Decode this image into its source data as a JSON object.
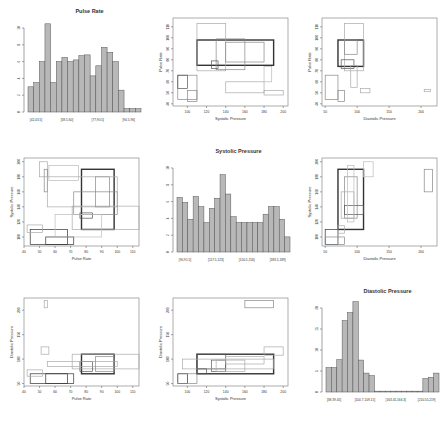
{
  "chart_data": [
    {
      "type": "bar",
      "cell": [
        0,
        0
      ],
      "title": "Pulse Rate",
      "xlabel": "",
      "ylabel": "",
      "ylim": [
        0,
        10
      ],
      "yticks": [
        0,
        2,
        4,
        6,
        8,
        10
      ],
      "categories": [
        "[42,43.5]",
        "",
        "",
        "",
        "",
        "[58.5,60]",
        "",
        "",
        "",
        "",
        "",
        "",
        "[77,90.5]",
        "",
        "",
        "",
        "",
        "[94.5,96]",
        "",
        "",
        ""
      ],
      "tick_labels": [
        "[42,43.5]",
        "[58.5,60]",
        "[77,90.5]",
        "[94.5,96]"
      ],
      "values": [
        3.0,
        3.5,
        6.0,
        10.5,
        3.5,
        6.0,
        6.5,
        6.0,
        6.2,
        6.7,
        6.8,
        4.3,
        5.5,
        7.7,
        7.1,
        6.0,
        2.6,
        0.4,
        0.4,
        0.4
      ]
    },
    {
      "type": "scatter",
      "cell": [
        0,
        1
      ],
      "title": "",
      "xlabel": "Systolic Pressure",
      "ylabel": "Pulse Rate",
      "xlim": [
        85,
        205
      ],
      "ylim": [
        38,
        118
      ],
      "xticks": [
        100,
        120,
        140,
        160,
        180,
        200
      ],
      "yticks": [
        40,
        50,
        60,
        70,
        80,
        90,
        100,
        110
      ],
      "rects": [
        {
          "x0": 110,
          "x1": 190,
          "y0": 75,
          "y1": 98,
          "w": 2,
          "c": "#333"
        },
        {
          "x0": 110,
          "x1": 140,
          "y0": 70,
          "y1": 113,
          "w": 1,
          "c": "#aaa"
        },
        {
          "x0": 130,
          "x1": 160,
          "y0": 71,
          "y1": 99,
          "w": 1,
          "c": "#888"
        },
        {
          "x0": 140,
          "x1": 180,
          "y0": 78,
          "y1": 96,
          "w": 1,
          "c": "#888"
        },
        {
          "x0": 125,
          "x1": 132,
          "y0": 72,
          "y1": 79,
          "w": 1,
          "c": "#555"
        },
        {
          "x0": 90,
          "x1": 110,
          "y0": 44,
          "y1": 66,
          "w": 1,
          "c": "#888"
        },
        {
          "x0": 90,
          "x1": 100,
          "y0": 54,
          "y1": 66,
          "w": 1,
          "c": "#555"
        },
        {
          "x0": 100,
          "x1": 110,
          "y0": 42,
          "y1": 52,
          "w": 1,
          "c": "#888"
        },
        {
          "x0": 140,
          "x1": 180,
          "y0": 50,
          "y1": 60,
          "w": 1,
          "c": "#aaa"
        },
        {
          "x0": 180,
          "x1": 200,
          "y0": 48,
          "y1": 52,
          "w": 1,
          "c": "#aaa"
        },
        {
          "x0": 180,
          "x1": 188,
          "y0": 60,
          "y1": 74,
          "w": 1,
          "c": "#bbb"
        }
      ]
    },
    {
      "type": "scatter",
      "cell": [
        0,
        2
      ],
      "title": "",
      "xlabel": "Diastolic Pressure",
      "ylabel": "Pulse Rate",
      "xlim": [
        45,
        225
      ],
      "ylim": [
        38,
        118
      ],
      "xticks": [
        50,
        100,
        150,
        200
      ],
      "yticks": [
        40,
        50,
        60,
        70,
        80,
        90,
        100,
        110
      ],
      "rects": [
        {
          "x0": 70,
          "x1": 110,
          "y0": 74,
          "y1": 98,
          "w": 2,
          "c": "#333"
        },
        {
          "x0": 80,
          "x1": 110,
          "y0": 70,
          "y1": 113,
          "w": 1,
          "c": "#aaa"
        },
        {
          "x0": 75,
          "x1": 95,
          "y0": 72,
          "y1": 80,
          "w": 1,
          "c": "#555"
        },
        {
          "x0": 80,
          "x1": 100,
          "y0": 85,
          "y1": 98,
          "w": 1,
          "c": "#888"
        },
        {
          "x0": 50,
          "x1": 70,
          "y0": 44,
          "y1": 66,
          "w": 1,
          "c": "#888"
        },
        {
          "x0": 70,
          "x1": 80,
          "y0": 42,
          "y1": 52,
          "w": 1,
          "c": "#888"
        },
        {
          "x0": 90,
          "x1": 100,
          "y0": 55,
          "y1": 75,
          "w": 1,
          "c": "#aaa"
        },
        {
          "x0": 105,
          "x1": 120,
          "y0": 50,
          "y1": 54,
          "w": 1,
          "c": "#aaa"
        },
        {
          "x0": 205,
          "x1": 215,
          "y0": 51,
          "y1": 53,
          "w": 1,
          "c": "#aaa"
        }
      ]
    },
    {
      "type": "scatter",
      "cell": [
        1,
        0
      ],
      "title": "",
      "xlabel": "Pulse Rate",
      "ylabel": "Systolic Pressure",
      "xlim": [
        40,
        114
      ],
      "ylim": [
        88,
        205
      ],
      "xticks": [
        40,
        50,
        60,
        70,
        80,
        90,
        100,
        110
      ],
      "yticks": [
        100,
        120,
        140,
        160,
        180,
        200
      ],
      "rects": [
        {
          "x0": 77,
          "x1": 98,
          "y0": 110,
          "y1": 190,
          "w": 2,
          "c": "#333"
        },
        {
          "x0": 71,
          "x1": 114,
          "y0": 110,
          "y1": 141,
          "w": 1,
          "c": "#aaa"
        },
        {
          "x0": 72,
          "x1": 100,
          "y0": 130,
          "y1": 160,
          "w": 1,
          "c": "#888"
        },
        {
          "x0": 86,
          "x1": 95,
          "y0": 140,
          "y1": 180,
          "w": 1,
          "c": "#888"
        },
        {
          "x0": 76,
          "x1": 84,
          "y0": 125,
          "y1": 132,
          "w": 1,
          "c": "#555"
        },
        {
          "x0": 44,
          "x1": 68,
          "y0": 90,
          "y1": 110,
          "w": 1,
          "c": "#333"
        },
        {
          "x0": 54,
          "x1": 72,
          "y0": 90,
          "y1": 100,
          "w": 1,
          "c": "#333"
        },
        {
          "x0": 42,
          "x1": 52,
          "y0": 106,
          "y1": 116,
          "w": 1,
          "c": "#aaa"
        },
        {
          "x0": 50,
          "x1": 55,
          "y0": 180,
          "y1": 200,
          "w": 1,
          "c": "#aaa"
        },
        {
          "x0": 53,
          "x1": 55,
          "y0": 160,
          "y1": 190,
          "w": 1,
          "c": "#888"
        },
        {
          "x0": 56,
          "x1": 75,
          "y0": 175,
          "y1": 195,
          "w": 1,
          "c": "#bbb"
        },
        {
          "x0": 55,
          "x1": 100,
          "y0": 140,
          "y1": 180,
          "w": 1,
          "c": "#aaa"
        },
        {
          "x0": 60,
          "x1": 90,
          "y0": 100,
          "y1": 130,
          "w": 1,
          "c": "#bbb"
        }
      ]
    },
    {
      "type": "bar",
      "cell": [
        1,
        1
      ],
      "title": "Systolic Pressure",
      "xlabel": "",
      "ylabel": "",
      "ylim": [
        0,
        10
      ],
      "yticks": [
        0,
        2,
        4,
        6,
        8,
        10
      ],
      "tick_labels": [
        "[90,91.5]",
        "[117.5,123]",
        "[150.5,156]",
        "[183.5,189]"
      ],
      "values": [
        6.5,
        5.9,
        3.9,
        6.6,
        5.4,
        3.5,
        5.2,
        6.4,
        9.2,
        6.9,
        4.2,
        3.5,
        3.5,
        3.5,
        3.5,
        3.5,
        4.5,
        5.4,
        5.4,
        3.9,
        1.8
      ]
    },
    {
      "type": "scatter",
      "cell": [
        1,
        2
      ],
      "title": "",
      "xlabel": "Diastolic Pressure",
      "ylabel": "Systolic Pressure",
      "xlim": [
        45,
        225
      ],
      "ylim": [
        88,
        205
      ],
      "xticks": [
        50,
        100,
        150,
        200
      ],
      "yticks": [
        100,
        120,
        140,
        160,
        180,
        200
      ],
      "rects": [
        {
          "x0": 70,
          "x1": 110,
          "y0": 110,
          "y1": 190,
          "w": 2,
          "c": "#333"
        },
        {
          "x0": 80,
          "x1": 100,
          "y0": 125,
          "y1": 180,
          "w": 1,
          "c": "#888"
        },
        {
          "x0": 75,
          "x1": 95,
          "y0": 125,
          "y1": 160,
          "w": 1,
          "c": "#aaa"
        },
        {
          "x0": 80,
          "x1": 110,
          "y0": 130,
          "y1": 142,
          "w": 1,
          "c": "#555"
        },
        {
          "x0": 85,
          "x1": 95,
          "y0": 120,
          "y1": 195,
          "w": 1,
          "c": "#bbb"
        },
        {
          "x0": 50,
          "x1": 70,
          "y0": 90,
          "y1": 110,
          "w": 1,
          "c": "#333"
        },
        {
          "x0": 50,
          "x1": 80,
          "y0": 90,
          "y1": 100,
          "w": 1,
          "c": "#888"
        },
        {
          "x0": 70,
          "x1": 80,
          "y0": 105,
          "y1": 115,
          "w": 1,
          "c": "#aaa"
        },
        {
          "x0": 110,
          "x1": 125,
          "y0": 180,
          "y1": 200,
          "w": 1,
          "c": "#bbb"
        },
        {
          "x0": 205,
          "x1": 218,
          "y0": 160,
          "y1": 190,
          "w": 1,
          "c": "#888"
        }
      ]
    },
    {
      "type": "scatter",
      "cell": [
        2,
        0
      ],
      "title": "",
      "xlabel": "Pulse Rate",
      "ylabel": "Diastolic Pressure",
      "xlim": [
        40,
        114
      ],
      "ylim": [
        45,
        225
      ],
      "xticks": [
        40,
        50,
        60,
        70,
        80,
        90,
        100,
        110
      ],
      "yticks": [
        50,
        100,
        150,
        200
      ],
      "rects": [
        {
          "x0": 77,
          "x1": 98,
          "y0": 70,
          "y1": 110,
          "w": 2,
          "c": "#333"
        },
        {
          "x0": 71,
          "x1": 114,
          "y0": 80,
          "y1": 110,
          "w": 1,
          "c": "#aaa"
        },
        {
          "x0": 76,
          "x1": 84,
          "y0": 75,
          "y1": 95,
          "w": 1,
          "c": "#555"
        },
        {
          "x0": 55,
          "x1": 100,
          "y0": 85,
          "y1": 95,
          "w": 1,
          "c": "#aaa"
        },
        {
          "x0": 86,
          "x1": 98,
          "y0": 75,
          "y1": 105,
          "w": 1,
          "c": "#888"
        },
        {
          "x0": 44,
          "x1": 68,
          "y0": 50,
          "y1": 70,
          "w": 1,
          "c": "#333"
        },
        {
          "x0": 54,
          "x1": 72,
          "y0": 50,
          "y1": 70,
          "w": 1,
          "c": "#333"
        },
        {
          "x0": 42,
          "x1": 52,
          "y0": 65,
          "y1": 78,
          "w": 1,
          "c": "#aaa"
        },
        {
          "x0": 51,
          "x1": 56,
          "y0": 110,
          "y1": 125,
          "w": 1,
          "c": "#aaa"
        },
        {
          "x0": 53,
          "x1": 55,
          "y0": 205,
          "y1": 220,
          "w": 1,
          "c": "#aaa"
        }
      ]
    },
    {
      "type": "scatter",
      "cell": [
        2,
        1
      ],
      "title": "",
      "xlabel": "Systolic Pressure",
      "ylabel": "Diastolic Pressure",
      "xlim": [
        85,
        205
      ],
      "ylim": [
        45,
        225
      ],
      "xticks": [
        100,
        120,
        140,
        160,
        180,
        200
      ],
      "yticks": [
        50,
        100,
        150,
        200
      ],
      "rects": [
        {
          "x0": 110,
          "x1": 190,
          "y0": 70,
          "y1": 110,
          "w": 2,
          "c": "#333"
        },
        {
          "x0": 110,
          "x1": 140,
          "y0": 80,
          "y1": 110,
          "w": 1,
          "c": "#555"
        },
        {
          "x0": 125,
          "x1": 140,
          "y0": 75,
          "y1": 98,
          "w": 1,
          "c": "#555"
        },
        {
          "x0": 130,
          "x1": 160,
          "y0": 75,
          "y1": 98,
          "w": 1,
          "c": "#aaa"
        },
        {
          "x0": 95,
          "x1": 190,
          "y0": 80,
          "y1": 100,
          "w": 1,
          "c": "#aaa"
        },
        {
          "x0": 140,
          "x1": 180,
          "y0": 90,
          "y1": 105,
          "w": 1,
          "c": "#aaa"
        },
        {
          "x0": 180,
          "x1": 200,
          "y0": 108,
          "y1": 125,
          "w": 1,
          "c": "#aaa"
        },
        {
          "x0": 90,
          "x1": 100,
          "y0": 50,
          "y1": 70,
          "w": 1,
          "c": "#333"
        },
        {
          "x0": 90,
          "x1": 110,
          "y0": 50,
          "y1": 70,
          "w": 1,
          "c": "#888"
        },
        {
          "x0": 110,
          "x1": 120,
          "y0": 70,
          "y1": 80,
          "w": 1,
          "c": "#555"
        },
        {
          "x0": 160,
          "x1": 190,
          "y0": 205,
          "y1": 220,
          "w": 1,
          "c": "#888"
        }
      ]
    },
    {
      "type": "bar",
      "cell": [
        2,
        2
      ],
      "title": "Diastolic Pressure",
      "xlabel": "",
      "ylabel": "",
      "ylim": [
        0,
        20
      ],
      "yticks": [
        0,
        5,
        10,
        15,
        20
      ],
      "tick_labels": [
        "[38,39.45]",
        "[100.7,109.15]",
        "[163.45,166.3]",
        "[210.55,219]"
      ],
      "values": [
        5.8,
        5.8,
        7.7,
        17.0,
        18.9,
        21.5,
        7.6,
        4.5,
        3.9,
        0.2,
        0.2,
        0.2,
        0.2,
        0.2,
        0.2,
        0.2,
        0.2,
        0.2,
        3.2,
        3.5,
        4.5
      ]
    }
  ]
}
